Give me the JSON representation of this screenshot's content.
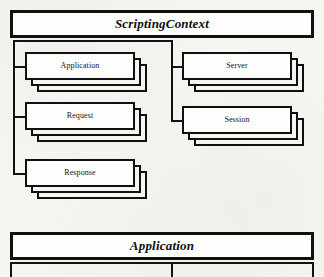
{
  "diagram": {
    "type": "uml-containment-diagram",
    "background_color": "#f6f5f1",
    "stroke_color": "#101010",
    "root": {
      "title": "ScriptingContext",
      "title_style": "bold-italic"
    },
    "children_left": [
      {
        "label": "Application",
        "multiplicity": "many",
        "stack_count": 3
      },
      {
        "label": "Request",
        "multiplicity": "many",
        "stack_count": 3
      },
      {
        "label": "Response",
        "multiplicity": "many",
        "stack_count": 3
      }
    ],
    "children_right": [
      {
        "label": "Server",
        "multiplicity": "many",
        "stack_count": 3
      },
      {
        "label": "Session",
        "multiplicity": "many",
        "stack_count": 3
      }
    ],
    "second_diagram": {
      "title": "Application",
      "title_style": "bold-italic",
      "note": "partially visible, cropped at bottom edge"
    }
  }
}
